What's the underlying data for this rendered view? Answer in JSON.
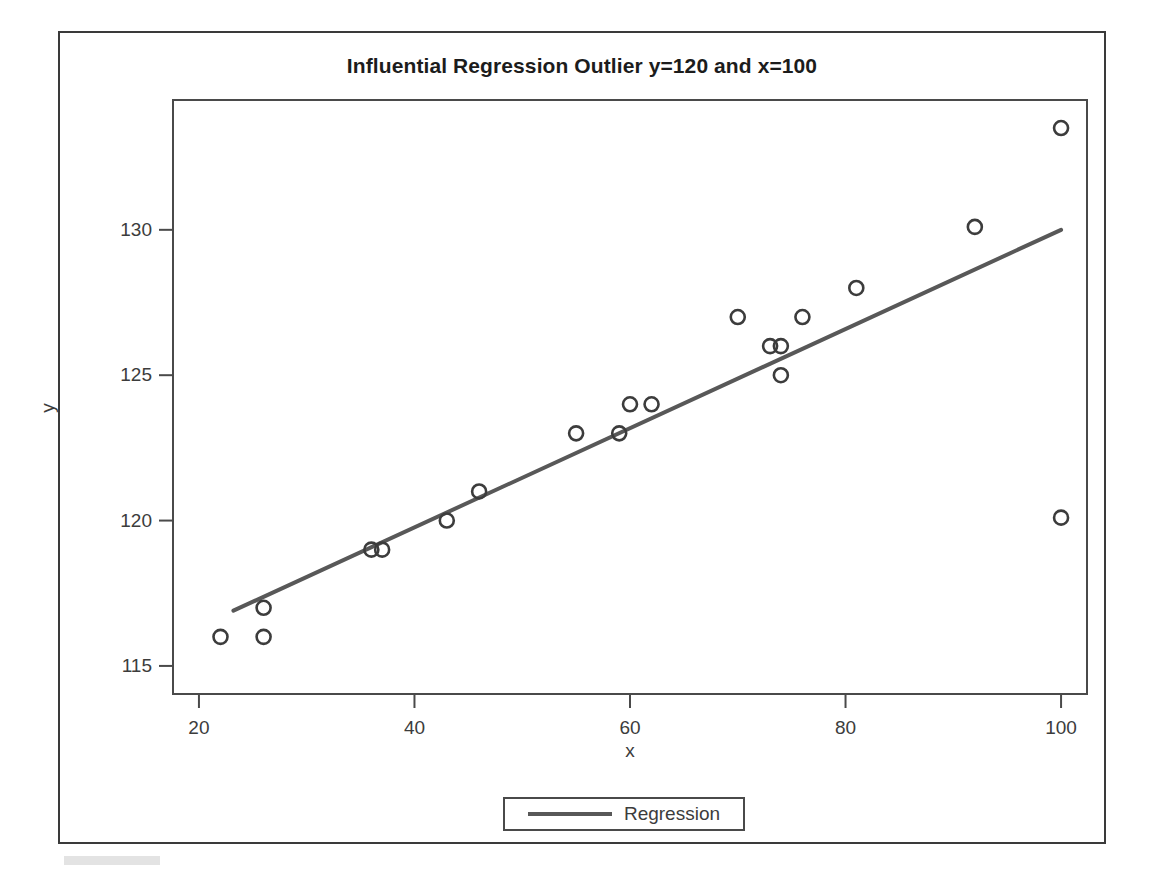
{
  "chart_data": {
    "type": "scatter",
    "title": "Influential Regression Outlier y=120 and x=100",
    "xlabel": "x",
    "ylabel": "y",
    "xlim": [
      17.5,
      102.5
    ],
    "ylim": [
      114.0,
      134.5
    ],
    "xticks": [
      20,
      40,
      60,
      80,
      100
    ],
    "yticks": [
      115,
      120,
      125,
      130
    ],
    "grid": false,
    "legend_position": "bottom-center",
    "marker": "open-circle",
    "marker_color": "#3c3c3c",
    "line_color": "#585858",
    "series": [
      {
        "name": "Observations",
        "type": "scatter",
        "points": [
          {
            "x": 22,
            "y": 116
          },
          {
            "x": 26,
            "y": 117
          },
          {
            "x": 26,
            "y": 116
          },
          {
            "x": 36,
            "y": 119
          },
          {
            "x": 37,
            "y": 119
          },
          {
            "x": 43,
            "y": 120
          },
          {
            "x": 46,
            "y": 121
          },
          {
            "x": 55,
            "y": 123
          },
          {
            "x": 59,
            "y": 123
          },
          {
            "x": 60,
            "y": 124
          },
          {
            "x": 62,
            "y": 124
          },
          {
            "x": 70,
            "y": 127
          },
          {
            "x": 73,
            "y": 126
          },
          {
            "x": 74,
            "y": 126
          },
          {
            "x": 74,
            "y": 125
          },
          {
            "x": 76,
            "y": 127
          },
          {
            "x": 81,
            "y": 128
          },
          {
            "x": 92,
            "y": 130.1
          },
          {
            "x": 100,
            "y": 133.5
          },
          {
            "x": 100,
            "y": 120.1
          }
        ]
      },
      {
        "name": "Regression",
        "type": "line",
        "endpoints": [
          {
            "x": 23.2,
            "y": 116.9
          },
          {
            "x": 100,
            "y": 130.0
          }
        ]
      }
    ],
    "legend": [
      {
        "label": "Regression",
        "marker": "line",
        "color": "#585858"
      }
    ],
    "annotations": []
  },
  "axis": {
    "x_tick_labels": [
      "20",
      "40",
      "60",
      "80",
      "100"
    ],
    "y_tick_labels": [
      "115",
      "120",
      "125",
      "130"
    ],
    "x_title": "x",
    "y_title": "y"
  },
  "legend": {
    "regression_label": "Regression"
  },
  "title": {
    "text": "Influential Regression Outlier y=120 and x=100"
  }
}
